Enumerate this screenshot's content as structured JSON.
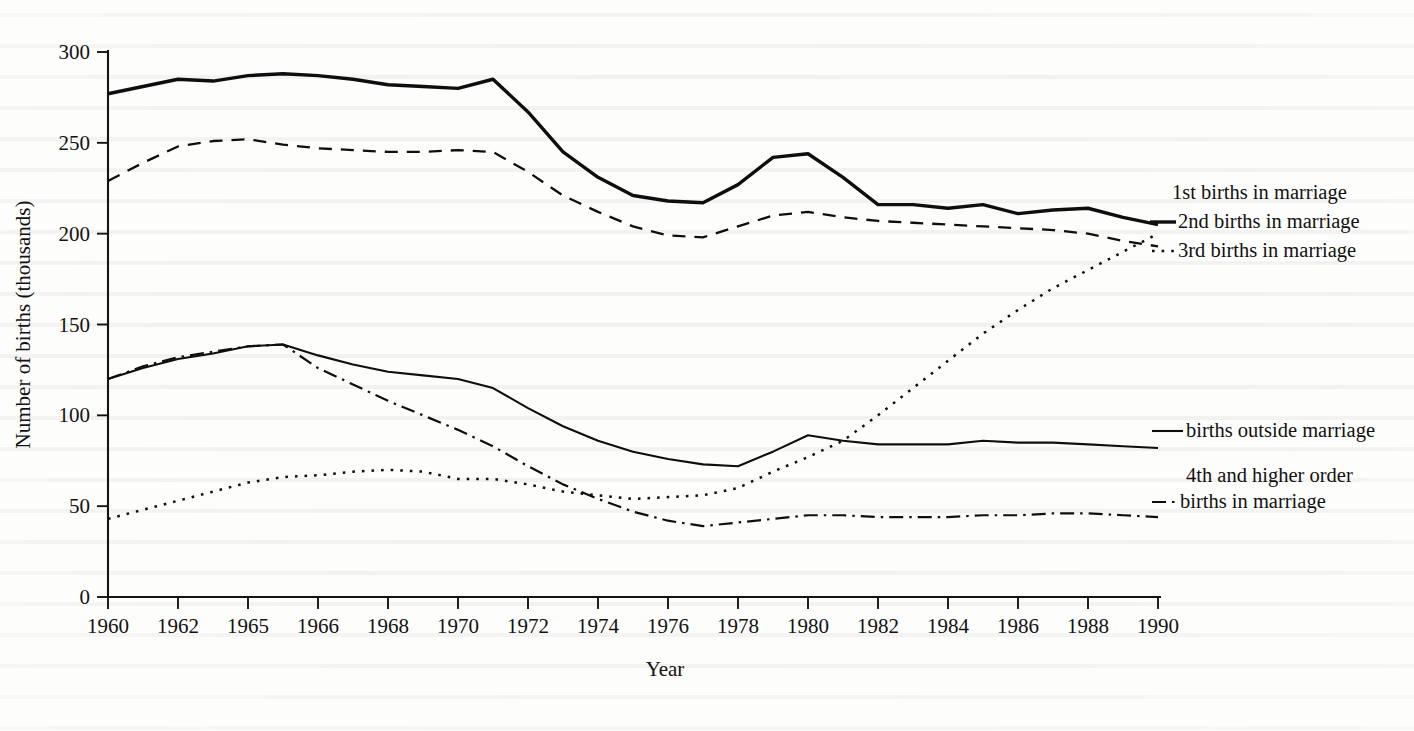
{
  "figure": {
    "y_axis_title": "Number of births (thousands)",
    "x_axis_title": "Year"
  },
  "chart_data": {
    "type": "line",
    "title": "",
    "xlabel": "Year",
    "ylabel": "Number of births (thousands)",
    "xlim": [
      1960,
      1990
    ],
    "ylim": [
      0,
      300
    ],
    "yticks": [
      0,
      50,
      100,
      150,
      200,
      250,
      300
    ],
    "xtick_labels": [
      "1960",
      "1962",
      "1965",
      "1966",
      "1968",
      "1970",
      "1972",
      "1974",
      "1976",
      "1978",
      "1980",
      "1982",
      "1984",
      "1986",
      "1988",
      "1990"
    ],
    "xtick_years": [
      1960,
      1962,
      1964,
      1966,
      1968,
      1970,
      1972,
      1974,
      1976,
      1978,
      1980,
      1982,
      1984,
      1986,
      1988,
      1990
    ],
    "grid": false,
    "legend_position": "right-inline",
    "x": [
      1960,
      1961,
      1962,
      1963,
      1964,
      1965,
      1966,
      1967,
      1968,
      1969,
      1970,
      1971,
      1972,
      1973,
      1974,
      1975,
      1976,
      1977,
      1978,
      1979,
      1980,
      1981,
      1982,
      1983,
      1984,
      1985,
      1986,
      1987,
      1988,
      1989,
      1990
    ],
    "series": [
      {
        "name": "1st births in marriage",
        "style": "solid-thick",
        "label_line1": "1st births in marriage",
        "label_line2": "",
        "values": [
          277,
          281,
          285,
          284,
          287,
          288,
          287,
          285,
          282,
          281,
          280,
          285,
          267,
          245,
          231,
          221,
          218,
          217,
          227,
          242,
          244,
          231,
          216,
          216,
          214,
          216,
          211,
          213,
          214,
          209,
          205
        ]
      },
      {
        "name": "2nd births in marriage",
        "style": "dashed",
        "label_line1": "2nd births in marriage",
        "label_line2": "",
        "values": [
          229,
          239,
          248,
          251,
          252,
          249,
          247,
          246,
          245,
          245,
          246,
          245,
          234,
          221,
          212,
          204,
          199,
          198,
          204,
          210,
          212,
          209,
          207,
          206,
          205,
          204,
          203,
          202,
          200,
          196,
          193
        ]
      },
      {
        "name": "3rd births in marriage",
        "style": "solid-thin",
        "label_line1": "3rd births in marriage",
        "label_line2": "",
        "values": [
          120,
          126,
          131,
          134,
          138,
          139,
          133,
          128,
          124,
          122,
          120,
          115,
          104,
          94,
          86,
          80,
          76,
          73,
          72,
          80,
          89,
          86,
          84,
          84,
          84,
          86,
          85,
          85,
          84,
          83,
          82
        ]
      },
      {
        "name": "births outside marriage",
        "style": "dotted",
        "label_line1": "births outside marriage",
        "label_line2": "",
        "values": [
          43,
          48,
          53,
          58,
          63,
          66,
          67,
          69,
          70,
          69,
          65,
          65,
          62,
          58,
          56,
          54,
          55,
          56,
          60,
          69,
          77,
          86,
          100,
          115,
          130,
          145,
          158,
          170,
          180,
          190,
          200
        ]
      },
      {
        "name": "4th and higher order births in marriage",
        "style": "dash-dot",
        "label_line1": "4th and higher order",
        "label_line2": "births in marriage",
        "values": [
          120,
          127,
          132,
          135,
          138,
          139,
          126,
          117,
          108,
          100,
          92,
          83,
          72,
          62,
          54,
          47,
          42,
          39,
          41,
          43,
          45,
          45,
          44,
          44,
          44,
          45,
          45,
          46,
          46,
          45,
          44
        ]
      }
    ]
  }
}
